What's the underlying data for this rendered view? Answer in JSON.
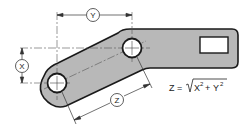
{
  "diagram": {
    "colors": {
      "part_fill": "#b8b8b8",
      "outline": "#1a1a1a",
      "dim_line": "#333333",
      "background": "#ffffff"
    },
    "dimensions": {
      "x": {
        "label": "X",
        "orientation": "vertical"
      },
      "y": {
        "label": "Y",
        "orientation": "horizontal"
      },
      "z": {
        "label": "Z",
        "orientation": "aligned"
      }
    },
    "formula": {
      "lhs": "Z =",
      "radical": "√",
      "term1": "X",
      "exp1": "2",
      "plus": "+",
      "term2": "Y",
      "exp2": "2",
      "full_text": "Z = √(X² + Y²)"
    },
    "features": {
      "hole_left": "round-hole",
      "hole_right": "round-hole",
      "slot": "rectangular-slot"
    }
  }
}
